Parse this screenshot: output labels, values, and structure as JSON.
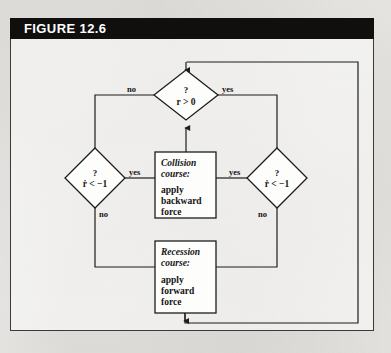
{
  "figure": {
    "caption": "FIGURE 12.6",
    "frame_color": "#3a3a3a",
    "caption_bar_color": "#100f0e",
    "paper_color": "#f2f1ef",
    "ink_color": "#1d1d1d"
  },
  "diagram": {
    "type": "flowchart",
    "nodes": [
      {
        "id": "decide-r",
        "shape": "diamond",
        "question_mark": "?",
        "expression": "r > 0",
        "branches": [
          "no",
          "yes"
        ]
      },
      {
        "id": "decide-rdot-left",
        "shape": "diamond",
        "question_mark": "?",
        "expression": "ṙ < −1",
        "branches": [
          "yes",
          "no"
        ]
      },
      {
        "id": "decide-rdot-right",
        "shape": "diamond",
        "question_mark": "?",
        "expression": "ṙ < −1",
        "branches": [
          "yes",
          "no"
        ]
      },
      {
        "id": "collision-course",
        "shape": "rectangle",
        "title": "Collision",
        "title2": "course:",
        "body": [
          "apply",
          "backward",
          "force"
        ]
      },
      {
        "id": "recession-course",
        "shape": "rectangle",
        "title": "Recession",
        "title2": "course:",
        "body": [
          "apply",
          "forward",
          "force"
        ]
      }
    ],
    "edge_labels": {
      "top_no": "no",
      "top_yes": "yes",
      "left_yes": "yes",
      "left_no": "no",
      "right_yes": "yes",
      "right_no": "no"
    }
  }
}
